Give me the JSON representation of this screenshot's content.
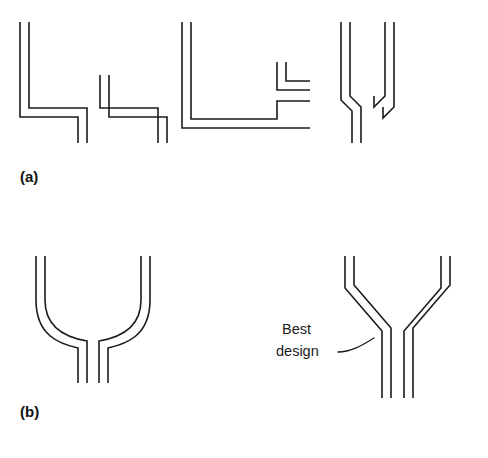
{
  "figure": {
    "background_color": "#ffffff",
    "line_color": "#1b1b1b",
    "caption_color": "#111111",
    "width": 488,
    "height": 458,
    "rows": [
      {
        "id": "row-a",
        "label": "(a)",
        "label_x": 20,
        "label_y": 182,
        "description": "Poor junction designs with abrupt right-angle transitions",
        "panels": [
          {
            "id": "panel-a-left",
            "name": "sharp-corner-y-junction",
            "design_quality": "poor",
            "corner_style": "square",
            "paths": [
              "M 20 22 L 20 117 L 78 117 L 78 143",
              "M 29 22 L 29 108 L 87 108 L 87 143",
              "M 100 75 L 100 108 L 158 108 L 158 143",
              "M 109 75 L 109 117 L 167 117 L 167 143"
            ]
          },
          {
            "id": "panel-a-middle",
            "name": "square-elbow-branch-duct",
            "design_quality": "poor",
            "corner_style": "square",
            "paths": [
              "M 182 22 L 182 128 L 310 128",
              "M 191 22 L 191 119 L 277 119 L 277 101 L 310 101",
              "M 277 62 L 277 90 L 310 90",
              "M 286 62 L 286 81 L 310 81"
            ]
          },
          {
            "id": "panel-a-right",
            "name": "chamfered-y-junction",
            "design_quality": "fair",
            "corner_style": "chamfer",
            "paths": [
              "M 341 22 L 341 100 L 352 111 L 352 143",
              "M 350 22 L 350 96 L 361 107 L 361 143",
              "M 374 96 L 374 107 L 385 96 L 385 22",
              "M 383 107 L 383 118 L 394 107 L 394 22"
            ]
          }
        ]
      },
      {
        "id": "row-b",
        "label": "(b)",
        "label_x": 20,
        "label_y": 417,
        "description": "Improved junction designs with gradual transitions",
        "panels": [
          {
            "id": "panel-b-left",
            "name": "curved-y-junction",
            "design_quality": "good",
            "corner_style": "curved",
            "paths": [
              "M 36 256 L 36 300 C 36 336 60 344 78 348 L 78 383",
              "M 45 256 L 45 300 C 45 330 69 338 87 341 L 87 383",
              "M 99 383 L 99 341 C 117 338 141 330 141 300 L 141 256",
              "M 108 383 L 108 348 C 126 344 150 336 150 300 L 150 256"
            ]
          },
          {
            "id": "panel-b-right",
            "name": "gradual-angled-y-junction",
            "design_quality": "best",
            "corner_style": "gradual-chamfer",
            "paths": [
              "M 345 256 L 345 288 L 382 331 L 382 398",
              "M 354 256 L 354 285 L 391 328 L 391 398",
              "M 404 398 L 404 331 L 441 288 L 441 256",
              "M 413 398 L 413 328 L 450 285 L 450 256"
            ]
          }
        ]
      }
    ],
    "callouts": [
      {
        "id": "best-design-callout",
        "name": "best-design-annotation",
        "line1": "Best",
        "line2": "design",
        "line1_x": 282,
        "line1_y": 334,
        "line2_x": 276,
        "line2_y": 356,
        "leader_path": "M 338 352 C 352 352 364 344 374 338"
      }
    ]
  }
}
